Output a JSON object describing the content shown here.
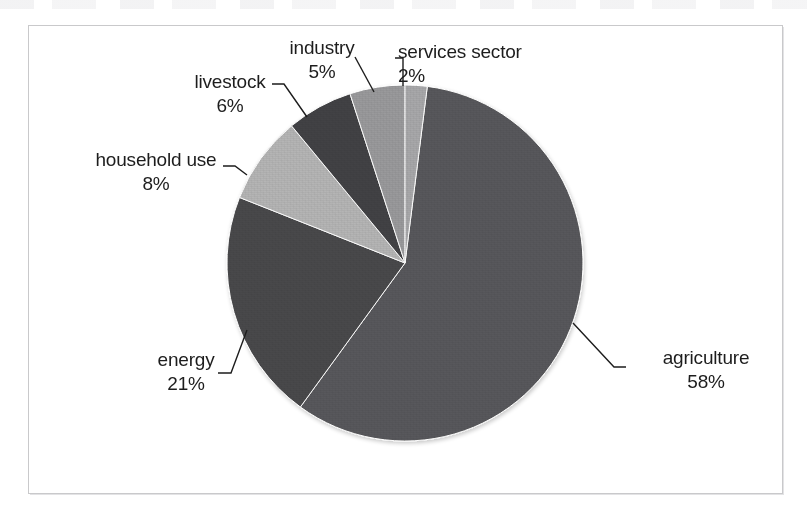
{
  "figure": {
    "frame_visible": true,
    "background_color": "#ffffff"
  },
  "chart_data": {
    "type": "pie",
    "title": "",
    "subtitle": "",
    "xlabel": "",
    "ylabel": "",
    "legend_position": "none",
    "grid": false,
    "labels_position": "outside-with-leader-lines",
    "start_angle_deg": 0,
    "direction": "clockwise",
    "units": "percent",
    "total": 100,
    "categories": [
      "agriculture",
      "energy",
      "household use",
      "livestock",
      "industry",
      "services sector"
    ],
    "values": [
      58,
      21,
      8,
      6,
      5,
      2
    ],
    "value_labels": [
      "58%",
      "21%",
      "8%",
      "6%",
      "5%",
      "2%"
    ],
    "colors": [
      "#59595b",
      "#4a4a4c",
      "#b5b5b5",
      "#434345",
      "#9a9a9c",
      "#a8a8aa"
    ],
    "slices": [
      {
        "name": "agriculture",
        "label": "agriculture",
        "percent": 58,
        "percent_label": "58%",
        "color": "#59595b",
        "start_deg": 7.2,
        "end_deg": 216.0
      },
      {
        "name": "energy",
        "label": "energy",
        "percent": 21,
        "percent_label": "21%",
        "color": "#4a4a4c",
        "start_deg": 216.0,
        "end_deg": 291.6
      },
      {
        "name": "household use",
        "label": "household use",
        "percent": 8,
        "percent_label": "8%",
        "color": "#b5b5b5",
        "start_deg": 291.6,
        "end_deg": 320.4
      },
      {
        "name": "livestock",
        "label": "livestock",
        "percent": 6,
        "percent_label": "6%",
        "color": "#434345",
        "start_deg": 320.4,
        "end_deg": 342.0
      },
      {
        "name": "industry",
        "label": "industry",
        "percent": 5,
        "percent_label": "5%",
        "color": "#9a9a9c",
        "start_deg": 342.0,
        "end_deg": 360.0
      },
      {
        "name": "services sector",
        "label": "services sector",
        "percent": 2,
        "percent_label": "2%",
        "color": "#a8a8aa",
        "start_deg": 0.0,
        "end_deg": 7.2
      }
    ]
  },
  "labels": {
    "agriculture": {
      "name": "agriculture",
      "percent": "58%"
    },
    "energy": {
      "name": "energy",
      "percent": "21%"
    },
    "household_use": {
      "name": "household use",
      "percent": "8%"
    },
    "livestock": {
      "name": "livestock",
      "percent": "6%"
    },
    "industry": {
      "name": "industry",
      "percent": "5%"
    },
    "services_sector": {
      "name": "services sector",
      "percent": "2%"
    }
  }
}
